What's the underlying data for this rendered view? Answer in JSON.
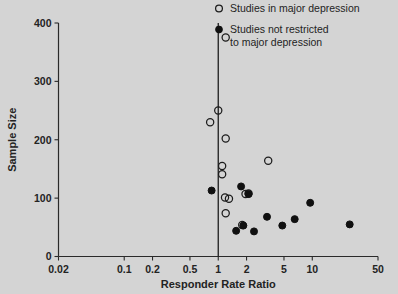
{
  "chart_data": {
    "type": "scatter",
    "title": "",
    "xlabel": "Responder Rate Ratio",
    "ylabel": "Sample Size",
    "xscale": "log",
    "xlim": [
      0.02,
      50
    ],
    "ylim": [
      0,
      400
    ],
    "xticks": [
      0.02,
      0.1,
      0.2,
      0.5,
      1,
      2,
      5,
      10,
      50
    ],
    "xtick_labels": [
      "0.02",
      "0.1",
      "0.2",
      "0.5",
      "1",
      "2",
      "5",
      "10",
      "50"
    ],
    "yticks": [
      0,
      100,
      200,
      300,
      400
    ],
    "ytick_labels": [
      "0",
      "100",
      "200",
      "300",
      "400"
    ],
    "grid": false,
    "reference_line": {
      "x": 1,
      "orientation": "vertical"
    },
    "legend_position": "top-right",
    "series": [
      {
        "name": "Studies in major depression",
        "marker": "open-circle",
        "color": "#1c1c1c",
        "points": [
          {
            "x": 1.2,
            "y": 375
          },
          {
            "x": 1.0,
            "y": 250
          },
          {
            "x": 0.82,
            "y": 230
          },
          {
            "x": 1.2,
            "y": 202
          },
          {
            "x": 1.1,
            "y": 155
          },
          {
            "x": 1.1,
            "y": 141
          },
          {
            "x": 3.4,
            "y": 164
          },
          {
            "x": 1.18,
            "y": 101
          },
          {
            "x": 1.3,
            "y": 99
          },
          {
            "x": 2.1,
            "y": 108
          },
          {
            "x": 1.95,
            "y": 107
          },
          {
            "x": 1.2,
            "y": 74
          },
          {
            "x": 1.8,
            "y": 54
          }
        ]
      },
      {
        "name": "Studies not restricted to major depression",
        "marker": "filled-circle",
        "color": "#101010",
        "points": [
          {
            "x": 0.85,
            "y": 113
          },
          {
            "x": 1.75,
            "y": 120
          },
          {
            "x": 2.1,
            "y": 107
          },
          {
            "x": 1.55,
            "y": 44
          },
          {
            "x": 1.85,
            "y": 53
          },
          {
            "x": 2.4,
            "y": 43
          },
          {
            "x": 3.3,
            "y": 68
          },
          {
            "x": 4.8,
            "y": 53
          },
          {
            "x": 6.5,
            "y": 64
          },
          {
            "x": 9.5,
            "y": 92
          },
          {
            "x": 25,
            "y": 55
          }
        ]
      }
    ]
  },
  "axes": {
    "x_label": "Responder Rate Ratio",
    "y_label": "Sample Size"
  },
  "legend": {
    "entries": [
      {
        "marker": "open-circle",
        "label": "Studies in major depression"
      },
      {
        "marker": "filled-circle",
        "label": "Studies not restricted",
        "label2": "to major depression"
      }
    ]
  },
  "colors": {
    "background": "#d4d4d4",
    "ink": "#232323",
    "marker": "#101010"
  }
}
